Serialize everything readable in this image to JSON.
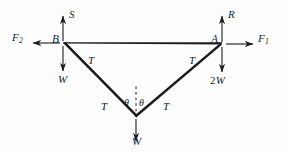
{
  "figure": {
    "points": {
      "b_label": "B",
      "a_label": "A"
    },
    "forces": {
      "f2": "F",
      "f2_sub": "2",
      "f1": "F",
      "f1_sub": "1",
      "s": "S",
      "r": "R",
      "w_left": "W",
      "w_bottom": "W",
      "two_w_prefix": "2",
      "two_w_symbol": "W"
    },
    "tensions": {
      "t_upper_left": "T",
      "t_lower_left": "T",
      "t_lower_right": "T",
      "t_upper_right": "T"
    },
    "angles": {
      "theta_left": "θ",
      "theta_right": "θ"
    },
    "colors": {
      "ink": "#1c1c1c",
      "background": "#fdfdfd"
    },
    "geometry": {
      "point_b": [
        63,
        43
      ],
      "point_a": [
        222,
        44
      ],
      "point_c": [
        136,
        117
      ]
    }
  }
}
